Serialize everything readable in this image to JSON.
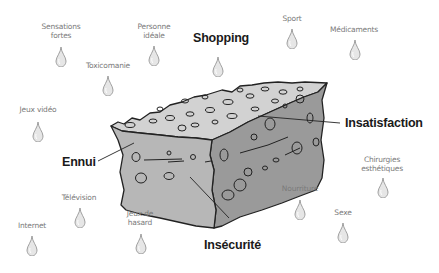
{
  "diagram": {
    "type": "illustration",
    "colors": {
      "background": "#ffffff",
      "sponge_top": "#d2d2d2",
      "sponge_front": "#b7b7b7",
      "sponge_side": "#9a9a9a",
      "outline": "#222222",
      "drop_fill": "#e6e6e6",
      "small_label": "#7a7a7a",
      "big_label": "#1a1a1a"
    },
    "big_labels": {
      "shopping": "Shopping",
      "insatisfaction": "Insatisfaction",
      "ennui": "Ennui",
      "insecurite": "Insécurité"
    },
    "drops": [
      {
        "id": "sensations-fortes",
        "line1": "Sensations",
        "line2": "fortes"
      },
      {
        "id": "personne-ideale",
        "line1": "Personne",
        "line2": "idéale"
      },
      {
        "id": "toxicomanie",
        "line1": "Toxicomanie",
        "line2": ""
      },
      {
        "id": "jeux-video",
        "line1": "Jeux vidéo",
        "line2": ""
      },
      {
        "id": "shopping",
        "line1": "",
        "line2": ""
      },
      {
        "id": "sport",
        "line1": "Sport",
        "line2": ""
      },
      {
        "id": "medicaments",
        "line1": "Médicaments",
        "line2": ""
      },
      {
        "id": "chirurgies-esthetiques",
        "line1": "Chirurgies",
        "line2": "esthétiques"
      },
      {
        "id": "nourriture",
        "line1": "Nourriture",
        "line2": ""
      },
      {
        "id": "sexe",
        "line1": "Sexe",
        "line2": ""
      },
      {
        "id": "television",
        "line1": "Télévision",
        "line2": ""
      },
      {
        "id": "internet",
        "line1": "Internet",
        "line2": ""
      },
      {
        "id": "jeux-de-hasard",
        "line1": "Jeux de",
        "line2": "hasard"
      }
    ]
  }
}
